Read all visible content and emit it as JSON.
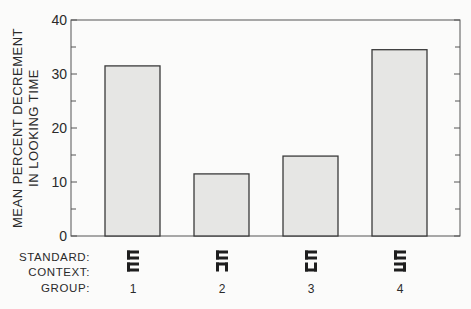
{
  "chart_data": {
    "type": "bar",
    "title": "",
    "xlabel": "",
    "ylabel": "MEAN PERCENT DECREMENT IN LOOKING TIME",
    "ylabel_lines": [
      "MEAN  PERCENT  DECREMENT",
      "IN  LOOKING  TIME"
    ],
    "ylim": [
      0,
      40
    ],
    "yticks": [
      0,
      10,
      20,
      30,
      40
    ],
    "minor_ticks": [
      5,
      15,
      25,
      35
    ],
    "grid": false,
    "legend": null,
    "categories": [
      "1",
      "2",
      "3",
      "4"
    ],
    "values": [
      31.5,
      11.5,
      14.8,
      34.5
    ],
    "bar_color": "#e6e6e4",
    "edge_color": "#3a3a3a",
    "row_labels": {
      "standard": "STANDARD:",
      "context": "CONTEXT:",
      "group": "GROUP:"
    },
    "stimuli": [
      {
        "group": "1",
        "standard": "bracket-open-right",
        "context": "bracket-open-right"
      },
      {
        "group": "2",
        "standard": "bracket-open-right",
        "context": "bracket-open-down"
      },
      {
        "group": "3",
        "standard": "bracket-open-right",
        "context": "bracket-open-up"
      },
      {
        "group": "4",
        "standard": "bracket-open-right",
        "context": "bracket-open-left"
      }
    ]
  }
}
